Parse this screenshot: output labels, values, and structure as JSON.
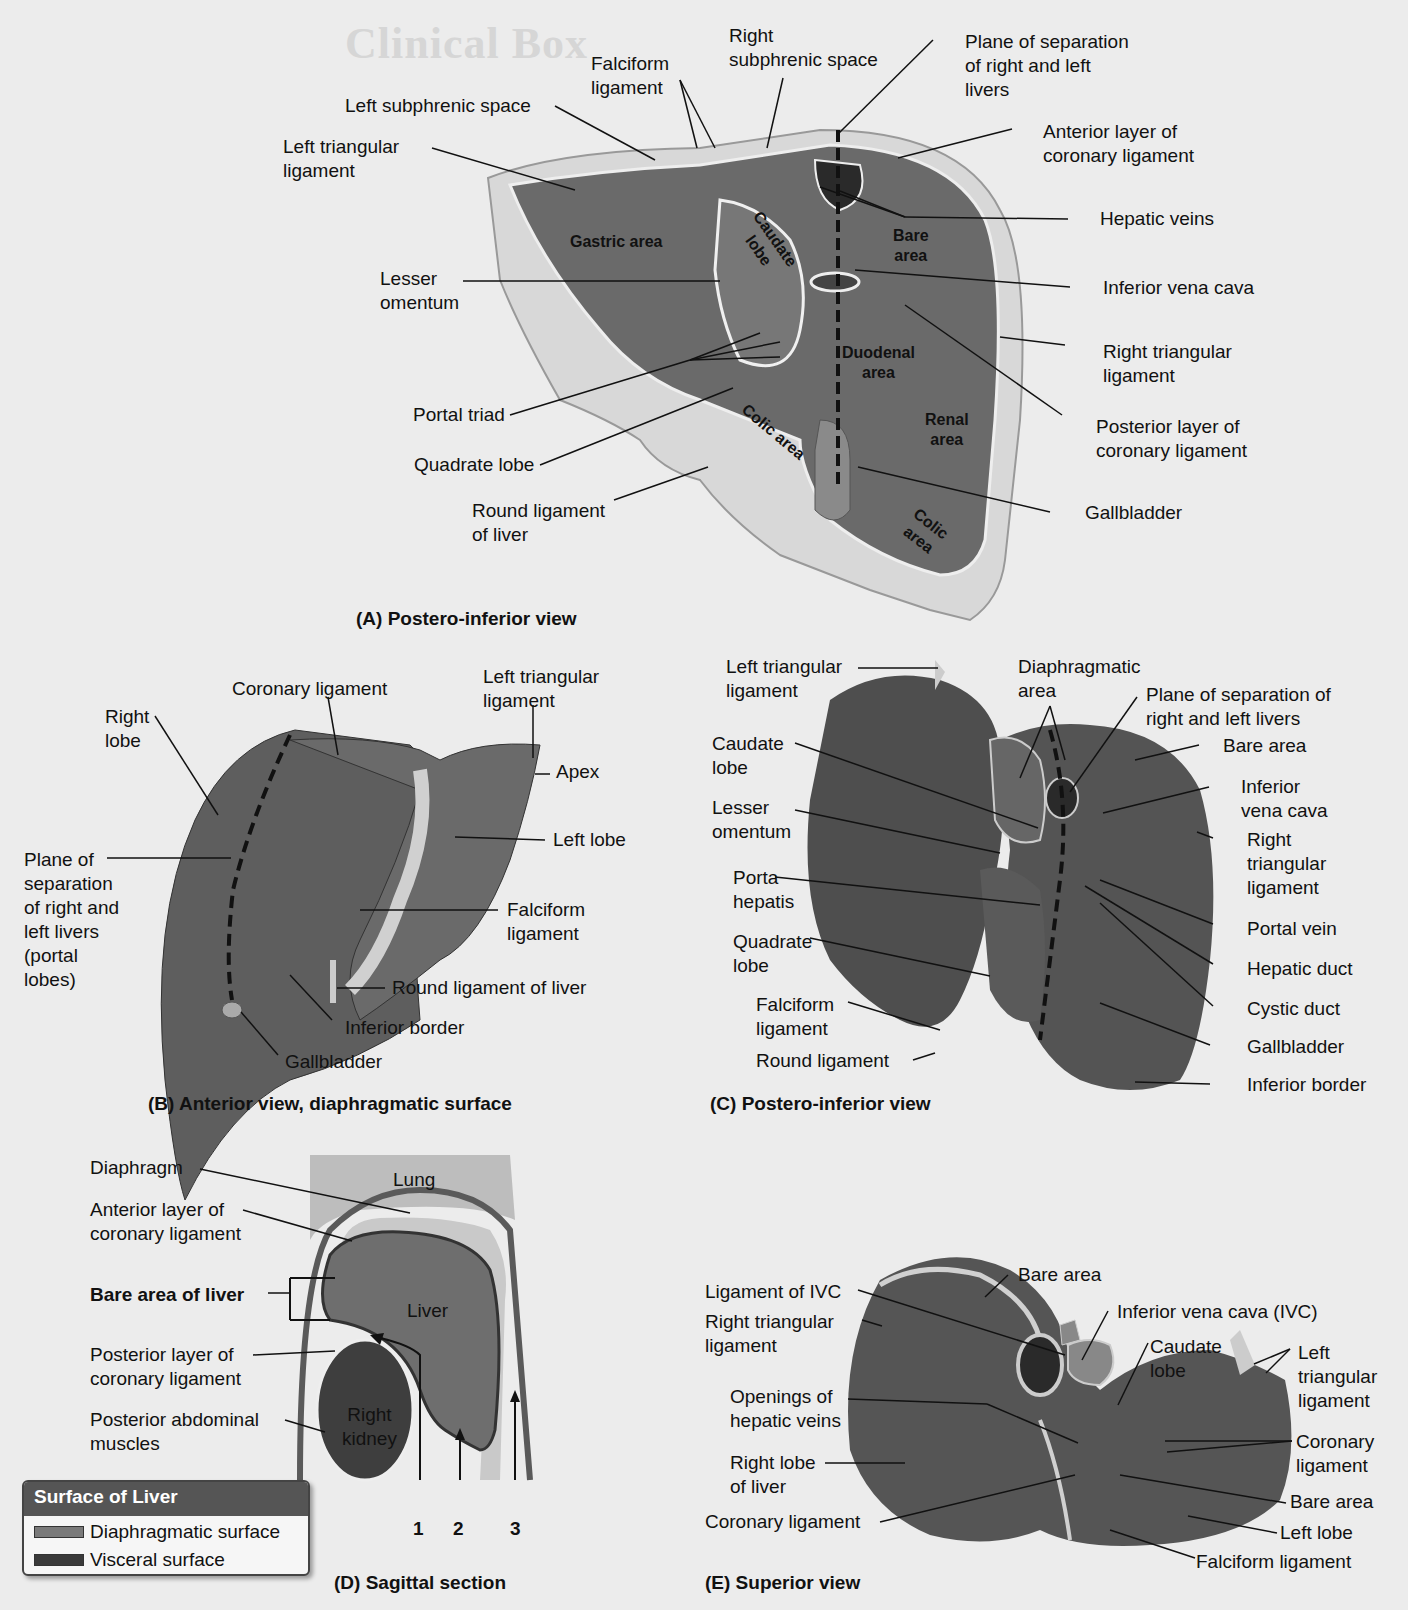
{
  "background": {
    "title": "Clinical Box"
  },
  "colors": {
    "liver_dark": "#4a4a4a",
    "liver_mid": "#6b6b6b",
    "peritoneum": "#d4d4d4",
    "diaphragmatic_surface": "#7a7a7a",
    "visceral_surface": "#3a3a3a",
    "legend_header": "#555555"
  },
  "panel_a": {
    "caption": "(A) Postero-inferior view",
    "inner_labels": {
      "gastric_area": "Gastric area",
      "caudate_lobe": "Caudate\nlobe",
      "bare_area": "Bare\narea",
      "duodenal_area": "Duodenal\narea",
      "renal_area": "Renal\narea",
      "colic_area_left": "Colic area",
      "colic_area_right": "Colic\narea"
    },
    "labels": {
      "falciform_ligament": "Falciform\nligament",
      "right_subphrenic_space": "Right\nsubphrenic space",
      "plane_of_separation": "Plane of separation\nof right and left\nlivers",
      "left_subphrenic_space": "Left subphrenic space",
      "left_triangular_ligament": "Left triangular\nligament",
      "anterior_layer_coronary": "Anterior layer of\ncoronary ligament",
      "hepatic_veins": "Hepatic veins",
      "lesser_omentum": "Lesser\nomentum",
      "inferior_vena_cava": "Inferior vena cava",
      "right_triangular_ligament": "Right triangular\nligament",
      "portal_triad": "Portal triad",
      "posterior_layer_coronary": "Posterior layer of\ncoronary ligament",
      "quadrate_lobe": "Quadrate lobe",
      "round_ligament": "Round ligament\nof liver",
      "gallbladder": "Gallbladder"
    }
  },
  "panel_b": {
    "caption": "(B) Anterior view, diaphragmatic surface",
    "labels": {
      "coronary_ligament": "Coronary ligament",
      "left_triangular_ligament": "Left triangular\nligament",
      "right_lobe": "Right\nlobe",
      "apex": "Apex",
      "left_lobe": "Left lobe",
      "plane_of_separation": "Plane of\nseparation\nof right and\nleft livers\n(portal\nlobes)",
      "falciform_ligament": "Falciform\nligament",
      "round_ligament": "Round ligament of liver",
      "inferior_border": "Inferior border",
      "gallbladder": "Gallbladder"
    }
  },
  "panel_c": {
    "caption": "(C) Postero-inferior view",
    "labels": {
      "left_triangular_ligament": "Left triangular\nligament",
      "diaphragmatic_area": "Diaphragmatic\narea",
      "plane_of_separation": "Plane of separation of\nright and left livers",
      "bare_area": "Bare area",
      "caudate_lobe": "Caudate\nlobe",
      "inferior_vena_cava": "Inferior\nvena cava",
      "lesser_omentum": "Lesser\nomentum",
      "right_triangular_ligament": "Right\ntriangular\nligament",
      "porta_hepatis": "Porta\nhepatis",
      "portal_vein": "Portal vein",
      "quadrate_lobe": "Quadrate\nlobe",
      "hepatic_duct": "Hepatic duct",
      "falciform_ligament": "Falciform\nligament",
      "cystic_duct": "Cystic duct",
      "round_ligament": "Round ligament",
      "gallbladder": "Gallbladder",
      "inferior_border": "Inferior border"
    }
  },
  "panel_d": {
    "caption": "(D) Sagittal section",
    "inner_labels": {
      "lung": "Lung",
      "liver": "Liver",
      "right_kidney": "Right\nkidney"
    },
    "labels": {
      "diaphragm": "Diaphragm",
      "anterior_layer_coronary": "Anterior layer of\ncoronary ligament",
      "bare_area_of_liver": "Bare area of liver",
      "posterior_layer_coronary": "Posterior layer of\ncoronary ligament",
      "posterior_abdominal_muscles": "Posterior abdominal\nmuscles"
    },
    "arrow_numbers": [
      "1",
      "2",
      "3"
    ]
  },
  "legend": {
    "title": "Surface of Liver",
    "items": [
      {
        "label": "Diaphragmatic surface",
        "color": "#7a7a7a"
      },
      {
        "label": "Visceral surface",
        "color": "#3a3a3a"
      }
    ]
  },
  "panel_e": {
    "caption": "(E) Superior view",
    "labels": {
      "bare_area_top": "Bare area",
      "ligament_of_ivc": "Ligament of IVC",
      "inferior_vena_cava": "Inferior vena cava (IVC)",
      "right_triangular_ligament": "Right triangular\nligament",
      "caudate_lobe": "Caudate\nlobe",
      "left_triangular_ligament": "Left\ntriangular\nligament",
      "openings_hepatic_veins": "Openings of\nhepatic veins",
      "coronary_ligament_right": "Coronary\nligament",
      "right_lobe": "Right lobe\nof liver",
      "bare_area_bottom": "Bare area",
      "coronary_ligament_left": "Coronary ligament",
      "left_lobe": "Left lobe",
      "falciform_ligament": "Falciform ligament"
    }
  }
}
